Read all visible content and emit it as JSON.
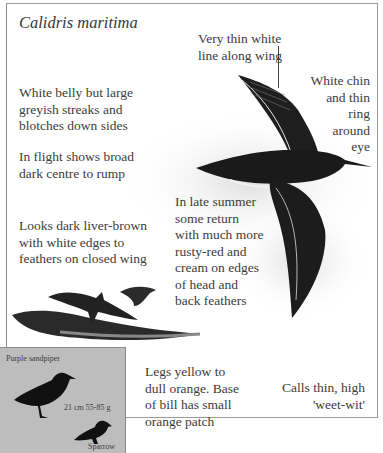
{
  "page": {
    "species_latin": "Calidris maritima",
    "annotations": {
      "wing_line": "Very thin white\nline along wing",
      "chin": "White chin\nand thin\nring\naround\neye",
      "belly": "White belly but large\ngreyish streaks and\nblotches down sides",
      "flight": "In flight shows broad\ndark centre to rump",
      "closed_wing": "Looks dark liver-brown\nwith white edges to\nfeathers on closed wing",
      "late_summer": "In late summer\nsome return\nwith much more\nrusty-red and\ncream on edges\nof head and\nback feathers",
      "legs": "Legs yellow to\ndull orange. Base\nof bill has small\norange patch",
      "calls": "Calls thin, high\n'weet-wit'"
    },
    "size_box": {
      "species_label": "Purple sandpiper",
      "measurements": "21 cm   55-85 g",
      "comparison_label": "Sparrow"
    }
  }
}
